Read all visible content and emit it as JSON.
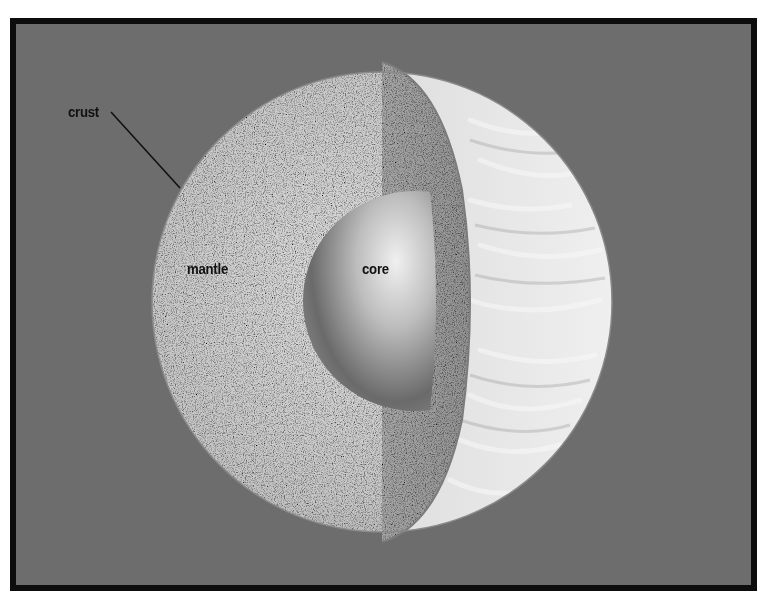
{
  "diagram": {
    "type": "planet-interior-cutaway",
    "colors": {
      "background": "#6d6d6d",
      "frame": "#0d0d0d",
      "label_text": "#111111",
      "mantle_face": "#c9c9c9",
      "cut_section": "#9a9a9a",
      "surface": "#d8d8d8",
      "core_light": "#e6e6e6",
      "core_dark": "#555555"
    },
    "labels": {
      "crust": "crust",
      "mantle": "mantle",
      "core": "core"
    }
  }
}
